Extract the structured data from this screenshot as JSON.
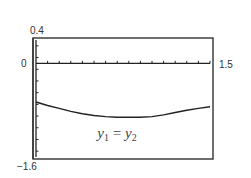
{
  "chart_data": {
    "type": "line",
    "title": "",
    "xlabel": "",
    "ylabel": "",
    "xlim": [
      0,
      1.5
    ],
    "ylim": [
      -1.6,
      0.4
    ],
    "x_tick_step": 0.1,
    "y_tick_step": 0.1,
    "grid": false,
    "window_labels": {
      "ymax": "0.4",
      "yzero": "0",
      "xmax": "1.5",
      "ymin": "-1.6"
    },
    "series": [
      {
        "name": "y1 = y2",
        "x": [
          0,
          0.1,
          0.2,
          0.3,
          0.4,
          0.5,
          0.6,
          0.7,
          0.8,
          0.9,
          1.0,
          1.1,
          1.2,
          1.3,
          1.4,
          1.5
        ],
        "y": [
          -0.66,
          -0.72,
          -0.77,
          -0.82,
          -0.86,
          -0.89,
          -0.91,
          -0.92,
          -0.92,
          -0.92,
          -0.91,
          -0.88,
          -0.84,
          -0.8,
          -0.77,
          -0.74
        ]
      }
    ],
    "annotations": [
      {
        "text_main": "y",
        "sub1": "1",
        "eq": " = ",
        "text_main2": "y",
        "sub2": "2",
        "x": 0.75,
        "y": -1.12
      }
    ]
  }
}
